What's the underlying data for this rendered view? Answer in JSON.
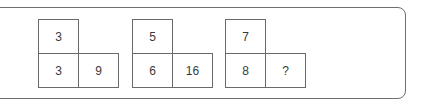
{
  "puzzle": {
    "groups": [
      {
        "top": "3",
        "bottom_left": "3",
        "bottom_right": "9"
      },
      {
        "top": "5",
        "bottom_left": "6",
        "bottom_right": "16"
      },
      {
        "top": "7",
        "bottom_left": "8",
        "bottom_right": "?"
      }
    ]
  },
  "colors": {
    "border": "#6a6a6a",
    "text": "#3a3a3a",
    "background": "#ffffff"
  }
}
